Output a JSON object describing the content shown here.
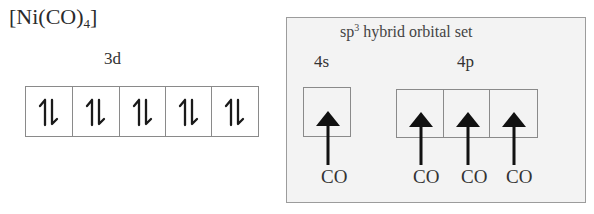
{
  "title": {
    "main": "[Ni(CO)",
    "subscript": "4",
    "close": "]"
  },
  "left_diagram": {
    "label": "3d",
    "cells": [
      {
        "electrons": "paired",
        "symbol": "↿⇂"
      },
      {
        "electrons": "paired",
        "symbol": "↿⇂"
      },
      {
        "electrons": "paired",
        "symbol": "↿⇂"
      },
      {
        "electrons": "paired",
        "symbol": "↿⇂"
      },
      {
        "electrons": "paired",
        "symbol": "↿⇂"
      }
    ]
  },
  "hybrid_panel": {
    "title_prefix": "sp",
    "title_sup": "3",
    "title_suffix": " hybrid orbital set",
    "orbital_4s": {
      "label": "4s",
      "cells": [
        {
          "arrow": "up",
          "ligand": "CO"
        }
      ]
    },
    "orbital_4p": {
      "label": "4p",
      "cells": [
        {
          "arrow": "up",
          "ligand": "CO"
        },
        {
          "arrow": "up",
          "ligand": "CO"
        },
        {
          "arrow": "up",
          "ligand": "CO"
        }
      ]
    }
  },
  "colors": {
    "panel_background": "#f3f3f3",
    "panel_border": "#9c9c9c",
    "box_border": "#8a8a8a",
    "arrow": "#111111",
    "text": "#333333"
  }
}
